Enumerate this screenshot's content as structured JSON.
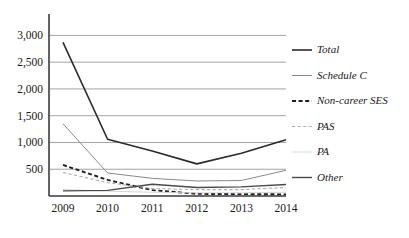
{
  "chart_data": {
    "type": "line",
    "title": "",
    "xlabel": "",
    "ylabel": "",
    "categories": [
      "2009",
      "2010",
      "2011",
      "2012",
      "2013",
      "2014"
    ],
    "x": [
      2009,
      2010,
      2011,
      2012,
      2013,
      2014
    ],
    "ylim": [
      0,
      3400
    ],
    "ytick_values": [
      500,
      1000,
      1500,
      2000,
      2500,
      3000
    ],
    "ytick_labels": [
      "500",
      "1,000",
      "1,500",
      "2,000",
      "2,500",
      "3,000"
    ],
    "grid": "horizontal",
    "legend_position": "right",
    "series": [
      {
        "name": "Total",
        "values": [
          2870,
          1060,
          840,
          600,
          800,
          1050
        ],
        "style": "solid",
        "width": 1.6,
        "color": "#2b2b2b"
      },
      {
        "name": "Schedule C",
        "values": [
          1350,
          430,
          330,
          280,
          290,
          480
        ],
        "style": "solid",
        "width": 1.0,
        "color": "#8a8a8a"
      },
      {
        "name": "Non-career SES",
        "values": [
          580,
          300,
          110,
          40,
          35,
          30
        ],
        "style": "dashed",
        "width": 1.9,
        "color": "#1f1f1f"
      },
      {
        "name": "PAS",
        "values": [
          440,
          250,
          140,
          120,
          120,
          160
        ],
        "style": "dashed",
        "width": 1.1,
        "color": "#b0b0b0"
      },
      {
        "name": "PA",
        "values": [
          120,
          90,
          70,
          60,
          60,
          70
        ],
        "style": "solid",
        "width": 0.9,
        "color": "#d2d2d2"
      },
      {
        "name": "Other",
        "values": [
          95,
          105,
          220,
          160,
          170,
          215
        ],
        "style": "solid",
        "width": 1.4,
        "color": "#4a4a4a"
      }
    ]
  },
  "legend": {
    "items": [
      {
        "label": "Total"
      },
      {
        "label": "Schedule C"
      },
      {
        "label": "Non-career SES"
      },
      {
        "label": "PAS"
      },
      {
        "label": "PA"
      },
      {
        "label": "Other"
      }
    ]
  },
  "axis": {
    "y_labels": [
      "3,000",
      "2,500",
      "2,000",
      "1,500",
      "1,000",
      "500"
    ],
    "x_labels": [
      "2009",
      "2010",
      "2011",
      "2012",
      "2013",
      "2014"
    ]
  },
  "colors": {
    "gridline": "#9a9a9a",
    "axis": "#3a3a3a",
    "total": "#2b2b2b",
    "schedule_c": "#8a8a8a",
    "non_career_ses": "#1f1f1f",
    "pas": "#b0b0b0",
    "pa": "#d2d2d2",
    "other": "#4a4a4a"
  }
}
